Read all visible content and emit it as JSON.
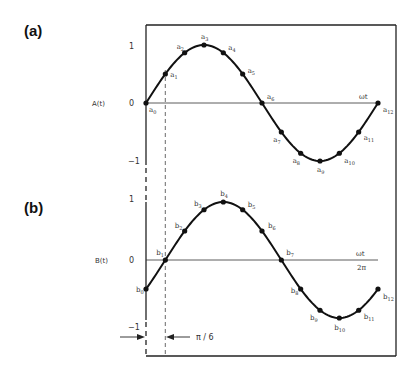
{
  "diagram": {
    "panels": [
      {
        "id": "a",
        "label": "(a)",
        "y_axis_label": "A(t)",
        "ticks": {
          "pos": "1",
          "zero": "0",
          "neg": "−1"
        },
        "x_axis_label": "ωt",
        "phase_offset_rad": 0,
        "amplitude": 1,
        "points_prefix": "a",
        "points": [
          "a0",
          "a1",
          "a2",
          "a3",
          "a4",
          "a5",
          "a6",
          "a7",
          "a8",
          "a9",
          "a10",
          "a11",
          "a12"
        ]
      },
      {
        "id": "b",
        "label": "(b)",
        "y_axis_label": "B(t)",
        "ticks": {
          "pos": "1",
          "zero": "0",
          "neg": "−1"
        },
        "x_axis_label": "ωt",
        "x_end_label": "2π",
        "phase_offset_rad": -0.5236,
        "amplitude": 1,
        "points_prefix": "b",
        "points": [
          "b0",
          "b1",
          "b2",
          "b3",
          "b4",
          "b5",
          "b6",
          "b7",
          "b8",
          "b9",
          "b10",
          "b11",
          "b12"
        ]
      }
    ],
    "samples_per_cycle": 12,
    "phase_shift_label": "π / 6"
  }
}
